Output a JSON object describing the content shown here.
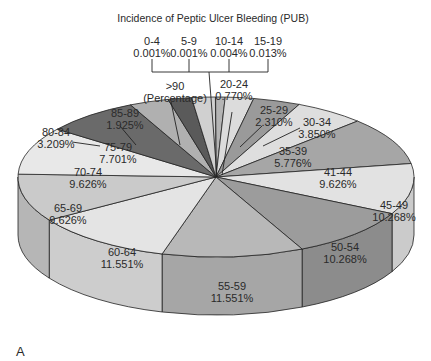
{
  "chart_data": {
    "type": "pie",
    "style": "3d",
    "title": "Incidence of Peptic Ulcer Bleeding (PUB)",
    "panel_label": "A",
    "unit_note": "(Percentage)",
    "slices": [
      {
        "label": "0-4",
        "value": 0.001,
        "display": "0.001%",
        "color": "#c8c8c8"
      },
      {
        "label": "5-9",
        "value": 0.001,
        "display": "0.001%",
        "color": "#c8c8c8"
      },
      {
        "label": "10-14",
        "value": 0.004,
        "display": "0.004%",
        "color": "#c8c8c8"
      },
      {
        "label": "15-19",
        "value": 0.013,
        "display": "0.013%",
        "color": "#c8c8c8"
      },
      {
        "label": "20-24",
        "value": 0.77,
        "display": "0.770%",
        "color": "#b4b4b4"
      },
      {
        "label": "25-29",
        "value": 2.31,
        "display": "2.310%",
        "color": "#dcdcdc"
      },
      {
        "label": "30-34",
        "value": 3.85,
        "display": "3.850%",
        "color": "#9a9a9a"
      },
      {
        "label": "35-39",
        "value": 5.776,
        "display": "5.776%",
        "color": "#dedede"
      },
      {
        "label": "41-44",
        "value": 9.626,
        "display": "9.626%",
        "color": "#a6a6a6"
      },
      {
        "label": "45-49",
        "value": 10.268,
        "display": "10.268%",
        "color": "#e2e2e2"
      },
      {
        "label": "50-54",
        "value": 10.268,
        "display": "10.268%",
        "color": "#9c9c9c"
      },
      {
        "label": "55-59",
        "value": 11.551,
        "display": "11.551%",
        "color": "#b8b8b8"
      },
      {
        "label": "60-64",
        "value": 11.551,
        "display": "11.551%",
        "color": "#e4e4e4"
      },
      {
        "label": "65-69",
        "value": 9.626,
        "display": "9.626%",
        "color": "#cacaca"
      },
      {
        "label": "70-74",
        "value": 9.626,
        "display": "9.626%",
        "color": "#e8e8e8"
      },
      {
        "label": "75-79",
        "value": 7.701,
        "display": "7.701%",
        "color": "#6a6a6a"
      },
      {
        "label": "80-84",
        "value": 3.209,
        "display": "3.209%",
        "color": "#b0b0b0"
      },
      {
        "label": "85-89",
        "value": 1.925,
        "display": "1.925%",
        "color": "#5a5a5a"
      },
      {
        "label": ">90",
        "value": 1.925,
        "display": "",
        "color": "#d0d0d0"
      }
    ],
    "legend": "none"
  }
}
